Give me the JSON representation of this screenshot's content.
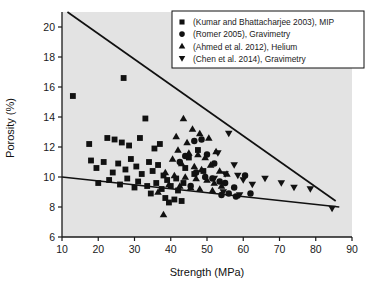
{
  "figure": {
    "background_color": "#ffffff",
    "plot_background_color": "#e3e3e3",
    "axis_color": "#1a1a1a",
    "marker_color": "#111111",
    "trendline_color": "#111111"
  },
  "chart_data": {
    "type": "scatter",
    "title": "",
    "xlabel": "Strength (MPa)",
    "ylabel": "Porosity (%)",
    "xlim": [
      10,
      90
    ],
    "ylim": [
      6,
      21
    ],
    "xticks": [
      10,
      20,
      30,
      40,
      50,
      60,
      70,
      80,
      90
    ],
    "yticks": [
      6,
      8,
      10,
      12,
      14,
      16,
      18,
      20
    ],
    "xtick_labels": [
      "10",
      "20",
      "30",
      "40",
      "50",
      "60",
      "70",
      "80",
      "90"
    ],
    "ytick_labels": [
      "6",
      "8",
      "10",
      "12",
      "14",
      "16",
      "18",
      "20"
    ],
    "grid": false,
    "legend_position": "top-right",
    "series": [
      {
        "name": "(Kumar and Bhattacharjee 2003), MIP",
        "marker": "square",
        "points": [
          [
            13.0,
            15.4
          ],
          [
            27.0,
            16.6
          ],
          [
            17.5,
            12.2
          ],
          [
            18.0,
            11.1
          ],
          [
            22.5,
            12.6
          ],
          [
            24.5,
            12.5
          ],
          [
            26.5,
            12.3
          ],
          [
            28.5,
            12.1
          ],
          [
            31.5,
            12.6
          ],
          [
            33.0,
            13.9
          ],
          [
            35.5,
            11.9
          ],
          [
            37.0,
            12.2
          ],
          [
            19.5,
            10.6
          ],
          [
            21.5,
            11.0
          ],
          [
            24.0,
            10.3
          ],
          [
            25.5,
            10.9
          ],
          [
            27.5,
            10.5
          ],
          [
            29.0,
            11.2
          ],
          [
            30.5,
            10.7
          ],
          [
            32.0,
            10.2
          ],
          [
            34.0,
            11.0
          ],
          [
            35.0,
            10.4
          ],
          [
            36.5,
            10.8
          ],
          [
            38.0,
            10.1
          ],
          [
            20.0,
            9.6
          ],
          [
            23.0,
            9.8
          ],
          [
            26.0,
            9.5
          ],
          [
            28.0,
            9.9
          ],
          [
            30.0,
            9.3
          ],
          [
            31.0,
            9.7
          ],
          [
            33.5,
            9.4
          ],
          [
            36.0,
            9.6
          ],
          [
            37.5,
            9.2
          ],
          [
            39.0,
            9.8
          ],
          [
            40.0,
            9.4
          ],
          [
            41.5,
            9.9
          ],
          [
            34.5,
            8.9
          ],
          [
            38.5,
            8.6
          ],
          [
            42.0,
            9.1
          ],
          [
            43.5,
            9.6
          ],
          [
            45.0,
            11.3
          ],
          [
            46.5,
            10.2
          ],
          [
            44.0,
            10.6
          ],
          [
            47.5,
            11.8
          ],
          [
            49.0,
            10.4
          ],
          [
            39.5,
            8.3
          ],
          [
            41.0,
            8.5
          ],
          [
            43.0,
            8.4
          ]
        ]
      },
      {
        "name": "(Romer 2005), Gravimetry",
        "marker": "circle",
        "points": [
          [
            46.5,
            12.4
          ],
          [
            48.5,
            12.5
          ],
          [
            44.0,
            11.4
          ],
          [
            50.0,
            11.5
          ],
          [
            42.5,
            11.0
          ],
          [
            52.0,
            10.9
          ],
          [
            47.0,
            10.3
          ],
          [
            49.5,
            10.0
          ],
          [
            51.5,
            9.9
          ],
          [
            53.5,
            9.7
          ],
          [
            45.5,
            9.4
          ],
          [
            55.0,
            9.6
          ],
          [
            57.5,
            9.3
          ],
          [
            60.5,
            10.1
          ],
          [
            54.0,
            8.8
          ],
          [
            56.0,
            8.9
          ],
          [
            58.0,
            8.7
          ],
          [
            62.0,
            8.9
          ]
        ]
      },
      {
        "name": "(Ahmed et al. 2012), Helium",
        "marker": "triangle-up",
        "points": [
          [
            43.5,
            13.9
          ],
          [
            46.0,
            13.2
          ],
          [
            41.5,
            12.7
          ],
          [
            48.0,
            12.9
          ],
          [
            44.5,
            12.3
          ],
          [
            50.5,
            12.6
          ],
          [
            42.0,
            11.8
          ],
          [
            45.0,
            11.6
          ],
          [
            47.5,
            11.5
          ],
          [
            49.5,
            11.3
          ],
          [
            52.5,
            11.7
          ],
          [
            40.5,
            11.2
          ],
          [
            43.0,
            10.9
          ],
          [
            46.5,
            10.7
          ],
          [
            48.5,
            10.5
          ],
          [
            51.0,
            10.8
          ],
          [
            53.5,
            10.4
          ],
          [
            38.5,
            10.3
          ],
          [
            41.0,
            10.1
          ],
          [
            44.0,
            10.0
          ],
          [
            47.0,
            9.9
          ],
          [
            50.0,
            9.8
          ],
          [
            52.0,
            9.6
          ],
          [
            55.5,
            10.2
          ],
          [
            39.5,
            9.5
          ],
          [
            42.5,
            9.4
          ],
          [
            45.5,
            9.3
          ],
          [
            48.0,
            9.2
          ],
          [
            51.5,
            9.1
          ],
          [
            54.0,
            9.4
          ],
          [
            36.5,
            9.0
          ],
          [
            38.0,
            7.5
          ]
        ]
      },
      {
        "name": "(Chen et al. 2014), Gravimetry",
        "marker": "triangle-down",
        "points": [
          [
            56.0,
            12.9
          ],
          [
            53.0,
            11.6
          ],
          [
            57.5,
            10.8
          ],
          [
            55.0,
            10.2
          ],
          [
            58.5,
            10.1
          ],
          [
            52.0,
            9.9
          ],
          [
            60.0,
            9.8
          ],
          [
            62.5,
            9.5
          ],
          [
            66.0,
            9.9
          ],
          [
            70.5,
            9.6
          ],
          [
            74.0,
            9.3
          ],
          [
            78.5,
            9.2
          ],
          [
            84.5,
            7.9
          ],
          [
            54.5,
            9.0
          ],
          [
            59.0,
            8.8
          ]
        ]
      }
    ],
    "trendlines": [
      {
        "name": "upper-bound-line",
        "start": [
          11.5,
          21.0
        ],
        "end": [
          85.5,
          8.4
        ]
      },
      {
        "name": "lower-bound-line",
        "start": [
          10.0,
          10.0
        ],
        "end": [
          86.5,
          8.0
        ]
      }
    ]
  },
  "legend": {
    "entries": [
      {
        "label": "(Kumar and Bhattacharjee 2003), MIP",
        "marker": "square"
      },
      {
        "label": "(Romer 2005), Gravimetry",
        "marker": "circle"
      },
      {
        "label": "(Ahmed et al. 2012), Helium",
        "marker": "triangle-up"
      },
      {
        "label": "(Chen et al. 2014), Gravimetry",
        "marker": "triangle-down"
      }
    ]
  }
}
